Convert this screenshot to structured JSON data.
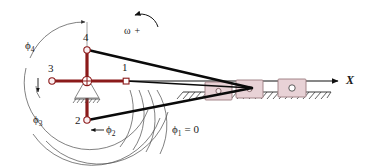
{
  "figure": {
    "type": "kinematic-mechanism-diagram",
    "title": "",
    "colors": {
      "crank": "#8B1A1A",
      "link": "#000000",
      "slider_fill": "#E8D2D6",
      "slider_stroke": "#9B7B80",
      "arc": "#4a4a4a",
      "ground": "#3a3a3a",
      "text": "#1a1a1a"
    }
  },
  "labels": {
    "joint_1": "1",
    "joint_2": "2",
    "joint_3": "3",
    "joint_4": "4",
    "phi_1": "ϕ",
    "phi_1_sub": "1",
    "phi_1_eq": "= 0",
    "phi_2": "ϕ",
    "phi_2_sub": "2",
    "phi_3": "ϕ",
    "phi_3_sub": "3",
    "phi_4": "ϕ",
    "phi_4_sub": "4",
    "omega": "ω",
    "omega_sign": "+",
    "axis_x": "X"
  },
  "geometry": {
    "pivot": {
      "x": 87,
      "y": 81
    },
    "joints": [
      {
        "id": "1",
        "x": 126,
        "y": 81
      },
      {
        "id": "2",
        "x": 87,
        "y": 120
      },
      {
        "id": "3",
        "x": 52,
        "y": 81
      },
      {
        "id": "4",
        "x": 87,
        "y": 50
      }
    ],
    "sliders": [
      {
        "x": 205,
        "y": 82,
        "w": 27,
        "h": 18
      },
      {
        "x": 236,
        "y": 80,
        "w": 27,
        "h": 18
      },
      {
        "x": 278,
        "y": 79,
        "w": 28,
        "h": 18
      }
    ],
    "ground_line": {
      "x1": 183,
      "x2": 330,
      "y": 92
    },
    "axis_arrow": {
      "x1": 140,
      "x2": 338,
      "y": 81
    },
    "phi_1_value": 0
  }
}
